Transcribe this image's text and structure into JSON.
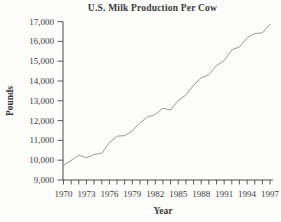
{
  "chart": {
    "title": "U.S. Milk Production Per Cow",
    "xlabel": "Year",
    "ylabel": "Pounds"
  },
  "chart_data": {
    "type": "line",
    "title": "U.S. Milk Production Per Cow",
    "xlabel": "Year",
    "ylabel": "Pounds",
    "x": [
      1970,
      1971,
      1972,
      1973,
      1974,
      1975,
      1976,
      1977,
      1978,
      1979,
      1980,
      1981,
      1982,
      1983,
      1984,
      1985,
      1986,
      1987,
      1988,
      1989,
      1990,
      1991,
      1992,
      1993,
      1994,
      1995,
      1996,
      1997
    ],
    "y": [
      9750,
      9990,
      10260,
      10120,
      10290,
      10360,
      10890,
      11210,
      11240,
      11490,
      11890,
      12180,
      12310,
      12620,
      12540,
      13020,
      13290,
      13790,
      14150,
      14320,
      14780,
      15030,
      15570,
      15720,
      16180,
      16400,
      16430,
      16870
    ],
    "xlim": [
      1970,
      1997
    ],
    "ylim": [
      9000,
      17000
    ],
    "y_tick_step": 1000,
    "y_tick_labels": [
      "9,000",
      "10,000",
      "11,000",
      "12,000",
      "13,000",
      "14,000",
      "15,000",
      "16,000",
      "17,000"
    ],
    "x_tick_label_step_years": 3,
    "x_tick_labels": [
      "1970",
      "1973",
      "1976",
      "1979",
      "1982",
      "1985",
      "1988",
      "1991",
      "1994",
      "1997"
    ],
    "grid": false,
    "legend": "none",
    "colors": {
      "line": "#8c8c8c",
      "axis": "#4a4a4a",
      "tick": "#4a4a4a",
      "text": "#3a3a3a",
      "background": "#fdfdfc"
    }
  }
}
